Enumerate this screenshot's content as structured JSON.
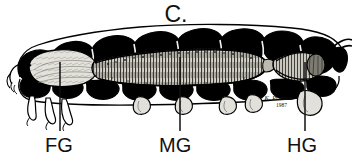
{
  "figure": {
    "panel_label": "C.",
    "caption_labels": [
      {
        "id": "fg",
        "text": "FG",
        "meaning": "foregut",
        "leader_x": 60,
        "leader_top": 62,
        "leader_bottom": 132
      },
      {
        "id": "mg",
        "text": "MG",
        "meaning": "midgut",
        "leader_x": 180,
        "leader_top": 58,
        "leader_bottom": 132
      },
      {
        "id": "hg",
        "text": "HG",
        "meaning": "hindgut",
        "leader_x": 305,
        "leader_top": 62,
        "leader_bottom": 132
      }
    ],
    "signature": {
      "artist_mark": "© K. Prather",
      "year": "1987"
    },
    "colors": {
      "ink": "#000000",
      "background": "#ffffff",
      "gut_fill": "#d8d5cd",
      "gut_shadow": "#8e8b83"
    },
    "subject": {
      "organism": "beetle larva",
      "view": "lateral",
      "body_segments": 11,
      "thoracic_legs": 3,
      "prolegs": 4,
      "tail_filament": true
    }
  }
}
